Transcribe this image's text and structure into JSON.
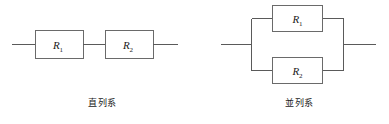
{
  "figure": {
    "background_color": "#ffffff",
    "line_color": "#5a5a5a",
    "text_color": "#1a1a1a"
  },
  "diagrams": [
    {
      "id": "series-circuit",
      "caption": "直列系",
      "topology": "series",
      "resistors": [
        {
          "symbol": "R",
          "subscript": "1",
          "full_label": "R1"
        },
        {
          "symbol": "R",
          "subscript": "2",
          "full_label": "R2"
        }
      ]
    },
    {
      "id": "parallel-circuit",
      "caption": "並列系",
      "topology": "parallel",
      "resistors": [
        {
          "symbol": "R",
          "subscript": "1",
          "full_label": "R1"
        },
        {
          "symbol": "R",
          "subscript": "2",
          "full_label": "R2"
        }
      ]
    }
  ]
}
